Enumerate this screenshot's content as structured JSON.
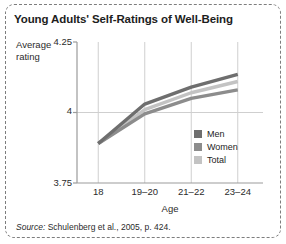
{
  "figure": {
    "title": "Young Adults' Self-Ratings of Well-Being",
    "source_keyword": "Source:",
    "source_text": " Schulenberg et al., 2005, p. 424."
  },
  "chart_data": {
    "type": "line",
    "title": "Young Adults' Self-Ratings of Well-Being",
    "xlabel": "Age",
    "ylabel": "Average rating",
    "categories": [
      "18",
      "19–20",
      "21–22",
      "23–24"
    ],
    "ylim": [
      3.75,
      4.25
    ],
    "yticks": [
      "3.75",
      "4",
      "4.25"
    ],
    "ytick_values": [
      3.75,
      4,
      4.25
    ],
    "grid": true,
    "grid_axis": "both",
    "legend_position": "inside-bottom-right",
    "series": [
      {
        "name": "Men",
        "color": "#6e6e6e",
        "values": [
          3.89,
          4.03,
          4.09,
          4.135
        ]
      },
      {
        "name": "Women",
        "color": "#8c8c8c",
        "values": [
          3.89,
          3.995,
          4.05,
          4.08
        ]
      },
      {
        "name": "Total",
        "color": "#c3c3c3",
        "values": [
          3.89,
          4.01,
          4.07,
          4.11
        ]
      }
    ]
  },
  "colors": {
    "men": "#6e6e6e",
    "women": "#8c8c8c",
    "total": "#c3c3c3",
    "axis": "#9b9b9b",
    "grid": "#cfcfcf",
    "frame": "#7d7d7d",
    "text": "#1d1d1d"
  }
}
